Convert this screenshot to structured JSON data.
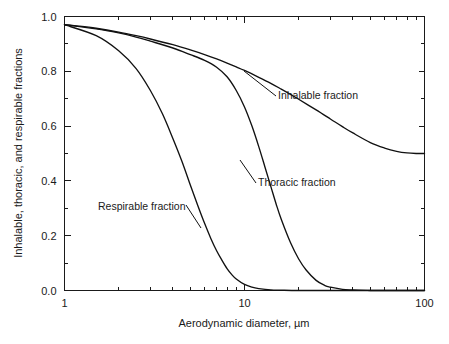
{
  "chart_data": {
    "type": "line",
    "title": "",
    "xlabel": "Aerodynamic diameter, µm",
    "ylabel": "Inhalable, thoracic, and respirable fractions",
    "xscale": "log",
    "xlim": [
      1,
      100
    ],
    "ylim": [
      0.0,
      1.0
    ],
    "grid": false,
    "legend_position": "inline-annotations",
    "xticks_major": [
      "1",
      "10",
      "100"
    ],
    "xtick_major_values": [
      1,
      10,
      100
    ],
    "xtick_minor_values": [
      2,
      3,
      4,
      5,
      6,
      7,
      8,
      9,
      20,
      30,
      40,
      50,
      60,
      70,
      80,
      90
    ],
    "yticks_major": [
      "0.0",
      "0.2",
      "0.4",
      "0.6",
      "0.8",
      "1.0"
    ],
    "ytick_major_values": [
      0.0,
      0.2,
      0.4,
      0.6,
      0.8,
      1.0
    ],
    "ytick_minor_values": [
      0.1,
      0.3,
      0.5,
      0.7,
      0.9
    ],
    "series": [
      {
        "name": "Inhalable fraction",
        "label_x": 278,
        "label_y": 99,
        "x": [
          1,
          1.2,
          1.5,
          2,
          2.5,
          3,
          4,
          5,
          6,
          7,
          8,
          9,
          10,
          12,
          14,
          16,
          18,
          20,
          25,
          30,
          35,
          40,
          50,
          60,
          70,
          80,
          90,
          100
        ],
        "y": [
          0.97,
          0.965,
          0.957,
          0.943,
          0.93,
          0.918,
          0.897,
          0.878,
          0.861,
          0.845,
          0.83,
          0.816,
          0.803,
          0.778,
          0.756,
          0.735,
          0.716,
          0.698,
          0.659,
          0.626,
          0.598,
          0.575,
          0.54,
          0.52,
          0.508,
          0.502,
          0.5,
          0.5
        ]
      },
      {
        "name": "Thoracic fraction",
        "label_x": 258,
        "label_y": 186,
        "x": [
          1,
          1.5,
          2,
          2.5,
          3,
          4,
          5,
          6,
          7,
          8,
          9,
          10,
          11,
          12,
          13,
          14,
          15,
          16,
          18,
          20,
          22,
          25,
          28,
          30,
          35,
          40,
          50,
          60,
          80,
          100
        ],
        "y": [
          0.97,
          0.955,
          0.94,
          0.925,
          0.91,
          0.885,
          0.861,
          0.84,
          0.815,
          0.78,
          0.73,
          0.67,
          0.6,
          0.525,
          0.45,
          0.38,
          0.315,
          0.26,
          0.175,
          0.115,
          0.075,
          0.037,
          0.018,
          0.012,
          0.004,
          0.002,
          0.0,
          0.0,
          0.0,
          0.0
        ]
      },
      {
        "name": "Respirable fraction",
        "label_x": 98,
        "label_y": 210,
        "x": [
          1,
          1.5,
          2,
          2.5,
          3,
          3.5,
          4,
          4.5,
          5,
          5.5,
          6,
          6.5,
          7,
          7.5,
          8,
          8.5,
          9,
          10,
          11,
          12,
          14,
          16,
          20,
          30,
          50,
          100
        ],
        "y": [
          0.97,
          0.93,
          0.875,
          0.81,
          0.73,
          0.645,
          0.555,
          0.47,
          0.385,
          0.31,
          0.245,
          0.19,
          0.145,
          0.11,
          0.08,
          0.058,
          0.042,
          0.022,
          0.012,
          0.007,
          0.002,
          0.001,
          0.0,
          0.0,
          0.0,
          0.0
        ]
      }
    ],
    "annotations": [
      {
        "text": "Inhalable fraction",
        "x": 278,
        "y": 99
      },
      {
        "text": "Thoracic fraction",
        "x": 258,
        "y": 186
      },
      {
        "text": "Respirable fraction",
        "x": 98,
        "y": 210
      }
    ]
  },
  "axes": {
    "x_title": "Aerodynamic diameter, µm",
    "y_title": "Inhalable, thoracic, and respirable fractions",
    "x_tick_labels": [
      "1",
      "10",
      "100"
    ],
    "y_tick_labels": [
      "1.0",
      "0.8",
      "0.6",
      "0.4",
      "0.2",
      "0.0"
    ]
  },
  "labels": {
    "inhalable": "Inhalable fraction",
    "thoracic": "Thoracic fraction",
    "respirable": "Respirable fraction"
  },
  "colors": {
    "curve": "#111111",
    "axis": "#1a1a1a",
    "background": "#ffffff"
  }
}
